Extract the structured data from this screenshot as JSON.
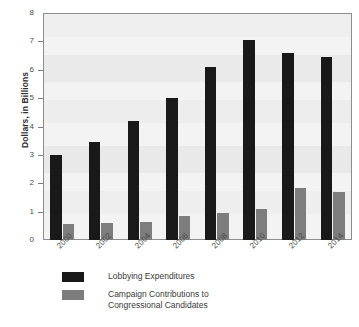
{
  "chart_data": {
    "type": "bar",
    "title": "",
    "subtitle": "",
    "xlabel": "",
    "ylabel": "Dollars, in Billions",
    "categories": [
      "2000",
      "2002",
      "2004",
      "2006",
      "2008",
      "2010",
      "2012",
      "2014"
    ],
    "series": [
      {
        "name": "Lobbying Expenditures",
        "color": "#191919",
        "values": [
          3.0,
          3.45,
          4.2,
          5.0,
          6.1,
          7.05,
          6.6,
          6.45
        ]
      },
      {
        "name": "Campaign Contributions to\nCongressional Candidates",
        "color": "#7d7d7d",
        "values": [
          0.57,
          0.6,
          0.65,
          0.85,
          0.95,
          1.08,
          1.82,
          1.7
        ]
      }
    ],
    "ylim": [
      0,
      8
    ],
    "yticks": [
      0,
      1,
      2,
      3,
      4,
      5,
      6,
      7,
      8
    ],
    "ytick_labels": [
      "0",
      "1",
      "2",
      "3",
      "4",
      "5",
      "6",
      "7",
      "8"
    ],
    "grid": false,
    "legend_position": "bottom-left",
    "plot_background": "#f3f3f3",
    "frame_color": "#8d8d8d"
  },
  "legend": {
    "entries": [
      {
        "label": "Lobbying Expenditures"
      },
      {
        "label": "Campaign Contributions to\nCongressional Candidates"
      }
    ]
  }
}
